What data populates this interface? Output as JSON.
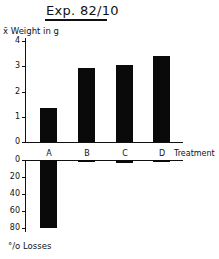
{
  "title": "Exp. 82/10",
  "chart_data": [
    {
      "type": "bar",
      "title": "Exp. 82/10",
      "ylabel": "x̄ Weight in g",
      "xlabel": "Treatment",
      "categories": [
        "A",
        "B",
        "C",
        "D"
      ],
      "values": [
        1.35,
        2.95,
        3.05,
        3.4
      ],
      "ylim": [
        0,
        4
      ],
      "yticks": [
        "0",
        "1",
        "2",
        "3",
        "4"
      ],
      "grid": false
    },
    {
      "type": "bar",
      "title": "",
      "ylabel": "% Losses",
      "xlabel": "",
      "categories": [
        "A",
        "B",
        "C",
        "D"
      ],
      "values": [
        80,
        2,
        4,
        1
      ],
      "ylim": [
        0,
        80
      ],
      "yticks": [
        "0",
        "20",
        "40",
        "60",
        "80"
      ],
      "inverted": true,
      "grid": false
    }
  ],
  "labels": {
    "top_ylabel": "x̄ Weight in g",
    "bottom_ylabel": "°/o Losses",
    "xlabel": "Treatment"
  }
}
